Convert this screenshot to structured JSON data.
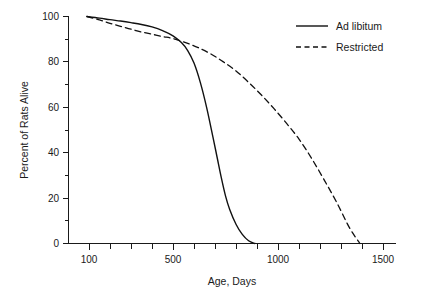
{
  "chart_data": {
    "type": "line",
    "title": "",
    "xlabel": "Age, Days",
    "ylabel": "Percent of Rats Alive",
    "xlim": [
      80,
      1550
    ],
    "ylim": [
      0,
      100
    ],
    "grid": false,
    "legend_position": "top-right",
    "x_ticks_major": [
      100,
      500,
      1000,
      1500
    ],
    "x_tick_labels": [
      "100",
      "500",
      "1000",
      "1500"
    ],
    "x_ticks_minor": [
      200,
      300,
      400,
      600,
      700,
      800,
      900,
      1100,
      1200,
      1300,
      1400
    ],
    "y_ticks_major": [
      0,
      20,
      40,
      60,
      80,
      100
    ],
    "y_tick_labels": [
      "0",
      "20",
      "40",
      "60",
      "80",
      "100"
    ],
    "y_ticks_minor": [
      10,
      30,
      50,
      70,
      90
    ],
    "series": [
      {
        "name": "Ad libitum",
        "style": "solid",
        "color": "#111111",
        "x": [
          90,
          150,
          200,
          250,
          300,
          350,
          400,
          450,
          500,
          540,
          570,
          600,
          630,
          660,
          690,
          710,
          730,
          750,
          770,
          800,
          830,
          860,
          890
        ],
        "values": [
          100,
          99.3,
          98.6,
          98.0,
          97.3,
          96.5,
          95.4,
          93.8,
          91.5,
          88.5,
          85.0,
          79.5,
          71.0,
          60.0,
          47.0,
          38.0,
          29.0,
          21.0,
          15.0,
          8.5,
          4.0,
          1.2,
          0
        ]
      },
      {
        "name": "Restricted",
        "style": "dashed",
        "color": "#111111",
        "x": [
          90,
          150,
          200,
          250,
          300,
          350,
          400,
          450,
          500,
          560,
          620,
          680,
          740,
          800,
          860,
          920,
          980,
          1040,
          1100,
          1160,
          1220,
          1280,
          1340,
          1390
        ],
        "values": [
          100,
          98.5,
          97.0,
          95.7,
          94.4,
          93.2,
          92.2,
          91.2,
          90.3,
          88.5,
          86.3,
          83.5,
          80.0,
          76.0,
          71.0,
          65.5,
          59.5,
          53.0,
          46.0,
          37.5,
          28.0,
          18.0,
          7.0,
          0
        ]
      }
    ]
  },
  "legend": {
    "items": [
      {
        "label": "Ad libitum",
        "style": "solid"
      },
      {
        "label": "Restricted",
        "style": "dashed"
      }
    ]
  },
  "axes": {
    "x_title": "Age, Days",
    "y_title": "Percent of Rats Alive"
  }
}
